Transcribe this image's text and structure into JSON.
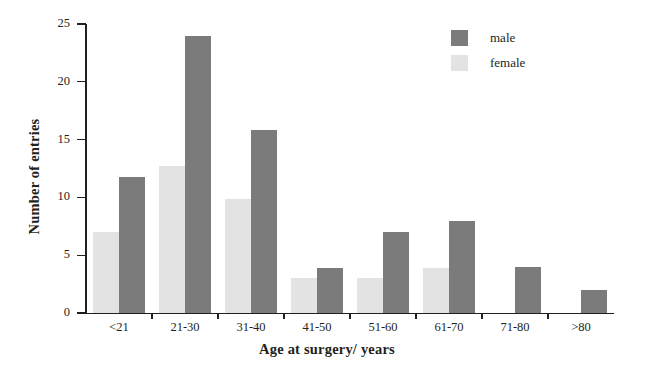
{
  "chart_data": {
    "type": "bar",
    "title": "",
    "xlabel": "Age at surgery/ years",
    "ylabel": "Number of entries",
    "categories": [
      "<21",
      "21-30",
      "31-40",
      "41-50",
      "51-60",
      "61-70",
      "71-80",
      ">80"
    ],
    "series": [
      {
        "name": "female",
        "color": "#e3e3e3",
        "values": [
          7,
          12.7,
          9.9,
          3,
          3,
          3.9,
          0,
          0
        ]
      },
      {
        "name": "male",
        "color": "#7b7b7b",
        "values": [
          11.8,
          24,
          15.8,
          3.9,
          7,
          8,
          4,
          2
        ]
      }
    ],
    "ylim": [
      0,
      25
    ],
    "yticks": [
      0,
      5,
      10,
      15,
      20,
      25
    ],
    "ytick_labels": [
      "0",
      "5",
      "10",
      "15",
      "20",
      "25"
    ],
    "grid": false,
    "legend_position": "top-right",
    "legend": [
      {
        "label": "male",
        "color": "#7b7b7b"
      },
      {
        "label": "female",
        "color": "#e3e3e3"
      }
    ]
  }
}
